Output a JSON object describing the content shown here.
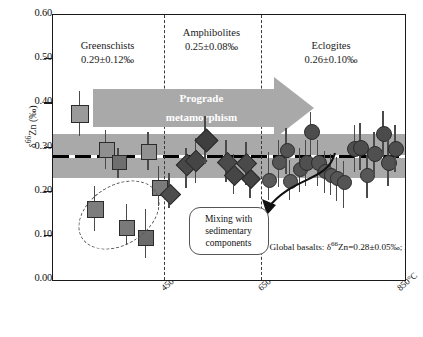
{
  "chart_data": {
    "type": "scatter",
    "title": "",
    "xlabel": "",
    "ylabel": "δ⁶⁶Zn (‰)",
    "ylim": [
      0.0,
      0.6
    ],
    "yticks": [
      "0.00",
      "0.10",
      "0.20",
      "0.30",
      "0.40",
      "0.50",
      "0.60"
    ],
    "xticks": [
      "450°C",
      "650°C",
      "850°C"
    ],
    "grid": false,
    "legend_position": "none",
    "reference_band": {
      "label": "Global basalts: δ⁶⁶Zn=0.28±0.05‰; 2SD",
      "mean": 0.28,
      "lower": 0.23,
      "upper": 0.33,
      "color": "#a9a9a9"
    },
    "regions": [
      {
        "name": "Greenschists",
        "value": "0.29±0.12‰",
        "mean": 0.29,
        "sd": 0.12
      },
      {
        "name": "Amphibolites",
        "value": "0.25±0.08‰",
        "mean": 0.25,
        "sd": 0.08
      },
      {
        "name": "Eclogites",
        "value": "0.26±0.10‰",
        "mean": 0.26,
        "sd": 0.1
      }
    ],
    "series": [
      {
        "name": "Greenschists",
        "marker": "square",
        "color": "#8c8c8c",
        "points": [
          {
            "x": 0.075,
            "y": 0.378,
            "yerr_low": 0.325,
            "yerr_high": 0.427,
            "size": 16,
            "fill": "#9a9a9a"
          },
          {
            "x": 0.15,
            "y": 0.296,
            "yerr_low": 0.252,
            "yerr_high": 0.34,
            "size": 14,
            "fill": "#8f8f8f"
          },
          {
            "x": 0.185,
            "y": 0.268,
            "yerr_low": 0.232,
            "yerr_high": 0.3,
            "size": 13,
            "fill": "#6e6e6e"
          },
          {
            "x": 0.27,
            "y": 0.292,
            "yerr_low": 0.248,
            "yerr_high": 0.336,
            "size": 14,
            "fill": "#919191"
          },
          {
            "x": 0.3,
            "y": 0.211,
            "yerr_low": 0.168,
            "yerr_high": 0.258,
            "size": 14,
            "fill": "#7a7a7a"
          },
          {
            "x": 0.118,
            "y": 0.163,
            "yerr_low": 0.112,
            "yerr_high": 0.212,
            "size": 15,
            "fill": "#7d7d7d"
          },
          {
            "x": 0.208,
            "y": 0.121,
            "yerr_low": 0.08,
            "yerr_high": 0.172,
            "size": 14,
            "fill": "#7a7a7a"
          },
          {
            "x": 0.262,
            "y": 0.097,
            "yerr_low": 0.05,
            "yerr_high": 0.16,
            "size": 14,
            "fill": "#6b6b6b"
          }
        ]
      },
      {
        "name": "Amphibolites",
        "marker": "diamond",
        "color": "#4a4a4a",
        "points": [
          {
            "x": 0.33,
            "y": 0.196,
            "yerr_low": 0.162,
            "yerr_high": 0.242,
            "size": 13,
            "fill": "#4d4d4d"
          },
          {
            "x": 0.378,
            "y": 0.262,
            "yerr_low": 0.208,
            "yerr_high": 0.3,
            "size": 14,
            "fill": "#484848"
          },
          {
            "x": 0.404,
            "y": 0.272,
            "yerr_low": 0.22,
            "yerr_high": 0.322,
            "size": 14,
            "fill": "#454545"
          },
          {
            "x": 0.432,
            "y": 0.318,
            "yerr_low": 0.262,
            "yerr_high": 0.372,
            "size": 15,
            "fill": "#3f3f3f"
          },
          {
            "x": 0.492,
            "y": 0.268,
            "yerr_low": 0.222,
            "yerr_high": 0.318,
            "size": 13,
            "fill": "#4a4a4a"
          },
          {
            "x": 0.512,
            "y": 0.24,
            "yerr_low": 0.195,
            "yerr_high": 0.286,
            "size": 13,
            "fill": "#464646"
          },
          {
            "x": 0.548,
            "y": 0.266,
            "yerr_low": 0.215,
            "yerr_high": 0.312,
            "size": 13,
            "fill": "#4a4a4a"
          },
          {
            "x": 0.56,
            "y": 0.232,
            "yerr_low": 0.186,
            "yerr_high": 0.276,
            "size": 12,
            "fill": "#444444"
          }
        ]
      },
      {
        "name": "Eclogites",
        "marker": "circle",
        "color": "#555555",
        "points": [
          {
            "x": 0.612,
            "y": 0.228,
            "yerr_low": 0.18,
            "yerr_high": 0.29,
            "size": 13,
            "fill": "#5a5a5a"
          },
          {
            "x": 0.64,
            "y": 0.268,
            "yerr_low": 0.21,
            "yerr_high": 0.318,
            "size": 13,
            "fill": "#565656"
          },
          {
            "x": 0.662,
            "y": 0.296,
            "yerr_low": 0.24,
            "yerr_high": 0.345,
            "size": 13,
            "fill": "#545454"
          },
          {
            "x": 0.672,
            "y": 0.226,
            "yerr_low": 0.18,
            "yerr_high": 0.272,
            "size": 13,
            "fill": "#5b5b5b"
          },
          {
            "x": 0.7,
            "y": 0.252,
            "yerr_low": 0.2,
            "yerr_high": 0.3,
            "size": 13,
            "fill": "#525252"
          },
          {
            "x": 0.718,
            "y": 0.268,
            "yerr_low": 0.212,
            "yerr_high": 0.318,
            "size": 14,
            "fill": "#4f4f4f"
          },
          {
            "x": 0.732,
            "y": 0.338,
            "yerr_low": 0.282,
            "yerr_high": 0.38,
            "size": 14,
            "fill": "#4d4d4d"
          },
          {
            "x": 0.752,
            "y": 0.268,
            "yerr_low": 0.212,
            "yerr_high": 0.318,
            "size": 14,
            "fill": "#535353"
          },
          {
            "x": 0.772,
            "y": 0.248,
            "yerr_low": 0.198,
            "yerr_high": 0.292,
            "size": 13,
            "fill": "#565656"
          },
          {
            "x": 0.788,
            "y": 0.24,
            "yerr_low": 0.192,
            "yerr_high": 0.286,
            "size": 13,
            "fill": "#585858"
          },
          {
            "x": 0.806,
            "y": 0.232,
            "yerr_low": 0.178,
            "yerr_high": 0.278,
            "size": 13,
            "fill": "#565656"
          },
          {
            "x": 0.826,
            "y": 0.222,
            "yerr_low": 0.162,
            "yerr_high": 0.27,
            "size": 13,
            "fill": "#545454"
          },
          {
            "x": 0.856,
            "y": 0.3,
            "yerr_low": 0.245,
            "yerr_high": 0.352,
            "size": 14,
            "fill": "#4f4f4f"
          },
          {
            "x": 0.872,
            "y": 0.302,
            "yerr_low": 0.248,
            "yerr_high": 0.355,
            "size": 14,
            "fill": "#4d4d4d"
          },
          {
            "x": 0.892,
            "y": 0.238,
            "yerr_low": 0.186,
            "yerr_high": 0.284,
            "size": 13,
            "fill": "#575757"
          },
          {
            "x": 0.912,
            "y": 0.288,
            "yerr_low": 0.236,
            "yerr_high": 0.336,
            "size": 14,
            "fill": "#505050"
          },
          {
            "x": 0.938,
            "y": 0.332,
            "yerr_low": 0.278,
            "yerr_high": 0.382,
            "size": 14,
            "fill": "#4b4b4b"
          },
          {
            "x": 0.952,
            "y": 0.268,
            "yerr_low": 0.212,
            "yerr_high": 0.318,
            "size": 14,
            "fill": "#525252"
          },
          {
            "x": 0.972,
            "y": 0.3,
            "yerr_low": 0.244,
            "yerr_high": 0.35,
            "size": 14,
            "fill": "#4e4e4e"
          }
        ]
      }
    ],
    "annotations": [
      {
        "name": "prograde-arrow",
        "text": "Prograde metamorphism",
        "color": "#a9a9a9"
      },
      {
        "name": "mixing-callout",
        "text": "Mixing with sedimentary components"
      },
      {
        "name": "basalt-note",
        "text": "Global basalts: δ⁶⁶Zn=0.28±0.05‰; 2SD"
      }
    ]
  },
  "axis": {
    "y_title_main": "Zn (‰)",
    "y_title_delta": "δ",
    "y_title_sup": "66",
    "y_ticks": [
      "0.60",
      "0.50",
      "0.40",
      "0.30",
      "0.20",
      "0.10",
      "0.00"
    ],
    "x_ticks": [
      "450°C",
      "650°C",
      "850°C"
    ]
  },
  "regions": {
    "greenschists": {
      "name": "Greenschists",
      "value": "0.29±0.12‰"
    },
    "amphibolites": {
      "name": "Amphibolites",
      "value": "0.25±0.08‰"
    },
    "eclogites": {
      "name": "Eclogites",
      "value": "0.26±0.10‰"
    }
  },
  "annotations": {
    "prograde_line1": "Prograde",
    "prograde_line2": "metamorphism",
    "mixing": "Mixing with sedimentary components",
    "basalt_note_pre": "Global basalts: ",
    "basalt_note_delta": "δ",
    "basalt_note_sup": "66",
    "basalt_note_post": "Zn=0.28±0.05‰; 2SD"
  }
}
